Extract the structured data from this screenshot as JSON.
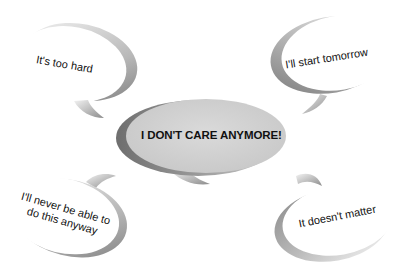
{
  "diagram": {
    "type": "thought-bubble-cluster",
    "center": {
      "text": "I DON'T CARE ANYMORE!",
      "fill": "#d2d2d2",
      "shadow": "#7a7a7a"
    },
    "bubbles": [
      {
        "id": "top-left",
        "text": "It's too hard"
      },
      {
        "id": "top-right",
        "text": "I'll start tomorrow"
      },
      {
        "id": "bottom-left",
        "line1": "I'll never be able to",
        "line2": "do this anyway"
      },
      {
        "id": "bottom-right",
        "text": "It doesn't matter"
      }
    ],
    "colors": {
      "background": "#ffffff",
      "bubble_fill": "#ffffff",
      "bubble_shadow_dark": "#8a8a8a",
      "bubble_shadow_light": "#eeeeee",
      "text": "#111111"
    }
  }
}
